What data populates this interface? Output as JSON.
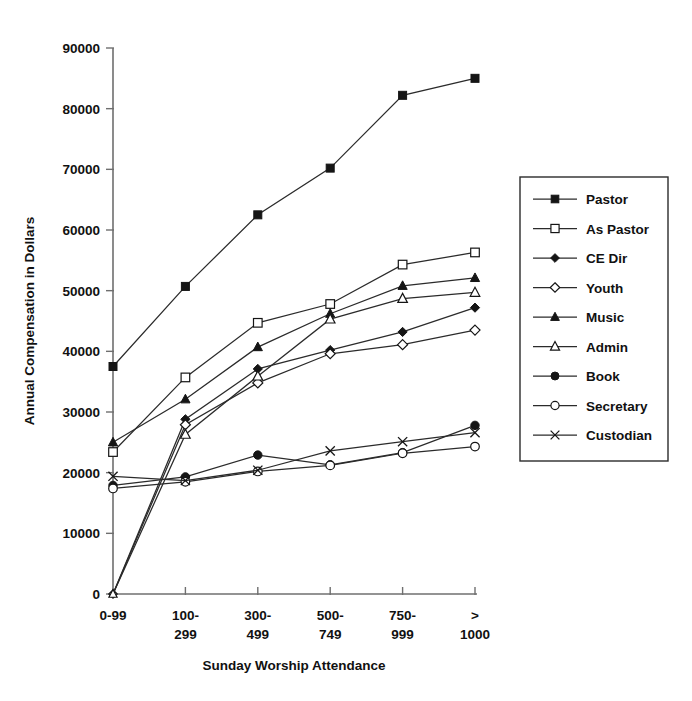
{
  "chart_data": {
    "type": "line",
    "title": "",
    "xlabel": "Sunday Worship Attendance",
    "ylabel": "Annual Compensation in Dollars",
    "categories": [
      "0-99",
      "100-299",
      "300-499",
      "500-749",
      "750-999",
      "> 1000"
    ],
    "category_lines": [
      [
        "0-99",
        ""
      ],
      [
        "100-",
        "299"
      ],
      [
        "300-",
        "499"
      ],
      [
        "500-",
        "749"
      ],
      [
        "750-",
        "999"
      ],
      [
        ">",
        "1000"
      ]
    ],
    "ylim": [
      0,
      90000
    ],
    "ytick_values": [
      0,
      10000,
      20000,
      30000,
      40000,
      50000,
      60000,
      70000,
      80000,
      90000
    ],
    "ytick_labels": [
      "0",
      "10000",
      "20000",
      "30000",
      "40000",
      "50000",
      "60000",
      "70000",
      "80000",
      "90000"
    ],
    "grid": false,
    "legend_position": "right",
    "series": [
      {
        "name": "Pastor",
        "marker": "filled-square",
        "values": [
          37500,
          50700,
          62500,
          70200,
          82200,
          85000
        ]
      },
      {
        "name": "As Pastor",
        "marker": "open-square",
        "values": [
          23400,
          35700,
          44700,
          47800,
          54300,
          56300
        ]
      },
      {
        "name": "CE Dir",
        "marker": "filled-diamond",
        "values": [
          0,
          28800,
          37100,
          40200,
          43200,
          47200
        ]
      },
      {
        "name": "Youth",
        "marker": "open-diamond",
        "values": [
          0,
          27900,
          34800,
          39600,
          41100,
          43500
        ]
      },
      {
        "name": "Music",
        "marker": "filled-triangle",
        "values": [
          25000,
          32100,
          40700,
          46200,
          50800,
          52100
        ]
      },
      {
        "name": "Admin",
        "marker": "open-triangle",
        "values": [
          0,
          26300,
          35900,
          45300,
          48700,
          49700
        ]
      },
      {
        "name": "Book",
        "marker": "filled-circle",
        "values": [
          17900,
          19300,
          22900,
          21300,
          23300,
          27800
        ]
      },
      {
        "name": "Secretary",
        "marker": "open-circle",
        "values": [
          17400,
          18500,
          20200,
          21200,
          23200,
          24300
        ]
      },
      {
        "name": "Custodian",
        "marker": "x-cross",
        "values": [
          19400,
          18700,
          20400,
          23600,
          25100,
          26600
        ]
      }
    ]
  },
  "legend": {
    "entries": [
      {
        "label": "Pastor",
        "marker": "filled-square"
      },
      {
        "label": "As Pastor",
        "marker": "open-square"
      },
      {
        "label": "CE Dir",
        "marker": "filled-diamond"
      },
      {
        "label": "Youth",
        "marker": "open-diamond"
      },
      {
        "label": "Music",
        "marker": "filled-triangle"
      },
      {
        "label": "Admin",
        "marker": "open-triangle"
      },
      {
        "label": "Book",
        "marker": "filled-circle"
      },
      {
        "label": "Secretary",
        "marker": "open-circle"
      },
      {
        "label": "Custodian",
        "marker": "x-cross"
      }
    ]
  },
  "colors": {
    "line": "#2b2b2b",
    "axis": "#6f6f6f",
    "text": "#111111",
    "background": "#ffffff"
  }
}
